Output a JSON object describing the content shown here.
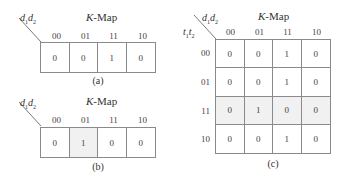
{
  "panels": {
    "a": {
      "title": "K-Map",
      "col_var": "d1d2",
      "col_headers": [
        "00",
        "01",
        "11",
        "10"
      ],
      "cells": [
        "0",
        "0",
        "1",
        "0"
      ],
      "shaded_cols": [],
      "caption": "(a)"
    },
    "b": {
      "title": "K-Map",
      "col_var": "d1d2",
      "col_headers": [
        "00",
        "01",
        "11",
        "10"
      ],
      "cells": [
        "0",
        "1",
        "0",
        "0"
      ],
      "shaded_cols": [
        "01"
      ],
      "caption": "(b)"
    },
    "c": {
      "title": "K-Map",
      "col_var": "d1d2",
      "row_var": "t1t2",
      "col_headers": [
        "00",
        "01",
        "11",
        "10"
      ],
      "row_headers": [
        "00",
        "01",
        "11",
        "10"
      ],
      "cells": [
        [
          "0",
          "0",
          "1",
          "0"
        ],
        [
          "0",
          "0",
          "1",
          "0"
        ],
        [
          "0",
          "1",
          "0",
          "0"
        ],
        [
          "0",
          "0",
          "1",
          "0"
        ]
      ],
      "shaded_rows": [
        "11"
      ],
      "caption": "(c)"
    }
  }
}
